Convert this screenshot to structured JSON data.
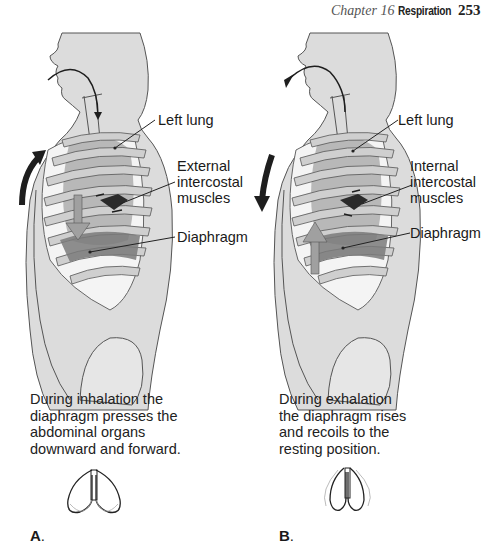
{
  "header": {
    "chapter": "Chapter 16",
    "section": "Respiration",
    "page_number": "253"
  },
  "panels": [
    {
      "letter": "A",
      "phase": "inhalation",
      "labels": {
        "lung": "Left lung",
        "muscles": "External\nintercostal\nmuscles",
        "diaphragm": "Diaphragm"
      },
      "caption": "During inhalation the\ndiaphragm presses the\nabdominal organs\ndownward and forward.",
      "chest_arrow": "up",
      "diaphragm_arrow": "down",
      "airflow": "in"
    },
    {
      "letter": "B",
      "phase": "exhalation",
      "labels": {
        "lung": "Left lung",
        "muscles": "Internal\nintercostal\nmuscles",
        "diaphragm": "Diaphragm"
      },
      "caption": "During exhalation\nthe diaphragm rises\nand recoils to the\nresting position.",
      "chest_arrow": "down",
      "diaphragm_arrow": "up",
      "airflow": "out"
    }
  ],
  "colors": {
    "body_fill": "#dcdcdc",
    "rib_fill": "#c8c8c8",
    "lung_fill": "#b4b4b4",
    "diaphragm_fill": "#7a7a7a",
    "muscle_fill": "#2a2a2a",
    "outline": "#4a4a4a",
    "arrow": "#1e1e1e"
  }
}
